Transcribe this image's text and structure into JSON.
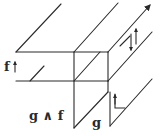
{
  "diagram": {
    "type": "commutative/string-diagram",
    "labels": {
      "f": "f",
      "g_and_f": "g ∧ f",
      "g": "g"
    },
    "arrows": {
      "f_arrow": "↑",
      "top_right_arrow": "up-right arrowhead on diagonal",
      "twist_up": "↑",
      "twist_down": "↓",
      "corner_up": "↑"
    },
    "colors": {
      "stroke": "#2a2a2a",
      "background": "#ffffff"
    }
  }
}
